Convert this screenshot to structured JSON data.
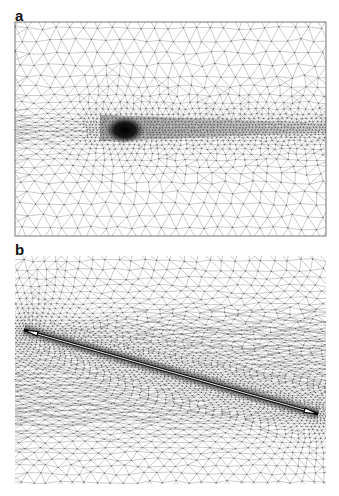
{
  "figure": {
    "panels": [
      {
        "label": "a",
        "description": "Triangular finite-element mesh with local refinement around a dense blob and a trailing refined streak",
        "frame": {
          "x": 15,
          "y": 22,
          "width": 311,
          "height": 214,
          "bordered": true
        },
        "refinement": {
          "core": {
            "cx": 125,
            "cy": 130,
            "rx": 13,
            "ry": 9
          },
          "streak": {
            "x_start": 100,
            "x_end": 325,
            "y_center": 128,
            "half_height_start": 22,
            "half_height_end": 8
          }
        }
      },
      {
        "label": "b",
        "description": "Triangular finite-element mesh refined along a diagonal crack line",
        "frame": {
          "x": 15,
          "y": 256,
          "width": 311,
          "height": 228,
          "bordered": false
        },
        "crack": {
          "x1": 24,
          "y1": 330,
          "x2": 318,
          "y2": 414
        }
      }
    ],
    "colors": {
      "mesh_line": "#8a8a8a",
      "node": "#555555",
      "dense": "#111111",
      "crack_center": "#ffffff",
      "frame": "#555555"
    }
  }
}
